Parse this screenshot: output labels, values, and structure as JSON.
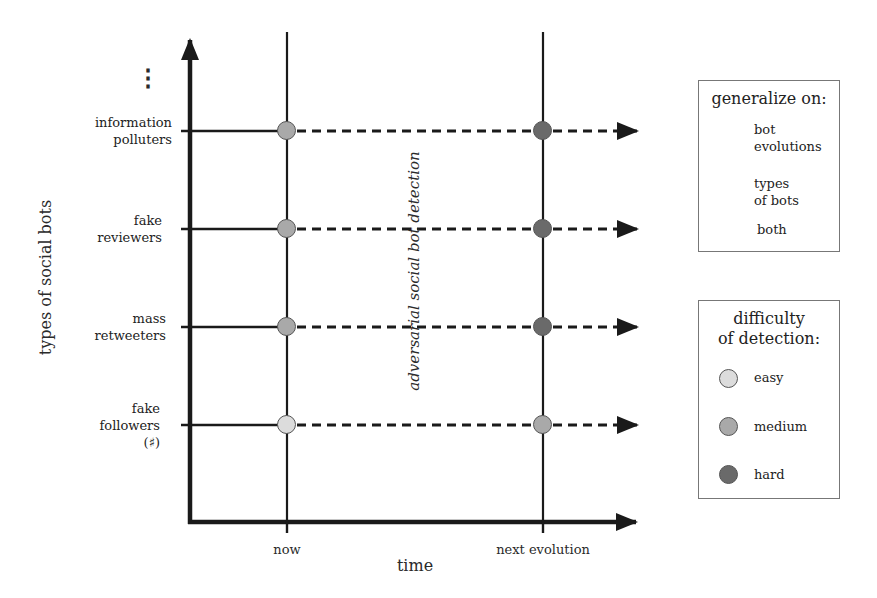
{
  "axes": {
    "y_label": "types of social bots",
    "x_label": "time",
    "x_ticks": [
      "now",
      "next evolution"
    ],
    "y_continuation": "⋮",
    "center_label": "adversarial social bot detection"
  },
  "rows": [
    {
      "label_line1": "information",
      "label_line2": "polluters",
      "label_line3": "",
      "now": "medium",
      "next": "hard"
    },
    {
      "label_line1": "fake",
      "label_line2": "reviewers",
      "label_line3": "",
      "now": "medium",
      "next": "hard"
    },
    {
      "label_line1": "mass",
      "label_line2": "retweeters",
      "label_line3": "",
      "now": "medium",
      "next": "hard"
    },
    {
      "label_line1": "fake",
      "label_line2": "followers",
      "label_line3": "(♯)",
      "now": "easy",
      "next": "medium"
    }
  ],
  "legend_generalize": {
    "title": "generalize on:",
    "items": [
      {
        "icon": "arrow-right-icon",
        "line1": "bot",
        "line2": "evolutions"
      },
      {
        "icon": "arrow-up-icon",
        "line1": "types",
        "line2": "of bots"
      },
      {
        "icon": "arrow-diagonal-icon",
        "line1": "both",
        "line2": ""
      }
    ]
  },
  "legend_difficulty": {
    "title_line1": "difficulty",
    "title_line2": "of detection:",
    "items": [
      {
        "level": "easy",
        "label": "easy",
        "color": "#dcdcdc"
      },
      {
        "level": "medium",
        "label": "medium",
        "color": "#a9a9a9"
      },
      {
        "level": "hard",
        "label": "hard",
        "color": "#6a6a6a"
      }
    ]
  },
  "colors": {
    "easy": "#dcdcdc",
    "medium": "#a9a9a9",
    "hard": "#6a6a6a",
    "line": "#1a1a1a"
  }
}
